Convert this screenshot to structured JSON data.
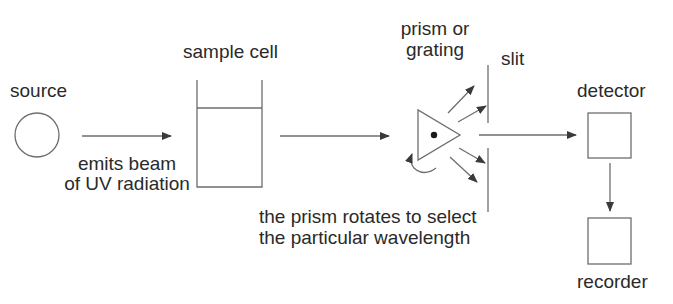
{
  "components": {
    "source": {
      "label": "source"
    },
    "sample_cell": {
      "label": "sample cell"
    },
    "prism": {
      "label_line1": "prism or",
      "label_line2": "grating"
    },
    "slit": {
      "label": "slit"
    },
    "detector": {
      "label": "detector"
    },
    "recorder": {
      "label": "recorder"
    }
  },
  "annotations": {
    "beam_line1": "emits beam",
    "beam_line2": "of UV radiation",
    "rotation_line1": "the prism rotates to select",
    "rotation_line2": "the particular wavelength"
  },
  "colors": {
    "stroke": "#6e6e6e",
    "text": "#2a2a2a",
    "arrow": "#3a3a3a"
  }
}
